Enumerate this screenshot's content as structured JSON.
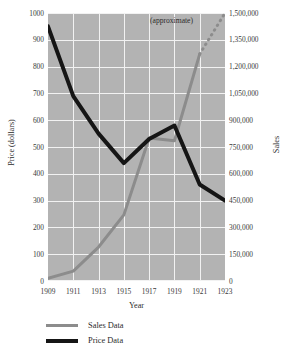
{
  "chart_data": {
    "type": "line",
    "title": "",
    "subtitle": "",
    "xlabel": "Year",
    "ylabel": "Price (dollars)",
    "ylabel_right": "Sales",
    "x": [
      1909,
      1911,
      1913,
      1915,
      1917,
      1919,
      1921,
      1923
    ],
    "xtick_labels": [
      "1909",
      "1911",
      "1913",
      "1915",
      "1917",
      "1919",
      "1921",
      "1923"
    ],
    "xlim": [
      1909,
      1923
    ],
    "ylim": [
      0,
      1000
    ],
    "ylim_right": [
      0,
      1500000
    ],
    "ytick_labels_left": [
      "1000",
      "900",
      "800",
      "700",
      "600",
      "500",
      "400",
      "300",
      "200",
      "100",
      "0"
    ],
    "ytick_values_left": [
      1000,
      900,
      800,
      700,
      600,
      500,
      400,
      300,
      200,
      100,
      0
    ],
    "ytick_labels_right": [
      "1,500,000",
      "1,350,000",
      "1,200,000",
      "1,050,000",
      "900,000",
      "750,000",
      "600,000",
      "450,000",
      "300,000",
      "150,000",
      "0"
    ],
    "ytick_values_right": [
      1500000,
      1350000,
      1200000,
      1050000,
      900000,
      750000,
      600000,
      450000,
      300000,
      150000,
      0
    ],
    "grid": true,
    "grid_color": "#f2f2f2",
    "plot_background": "#b3b3b3",
    "legend_position": "below",
    "annotations": [
      {
        "text": "(approximate)",
        "x": 1920,
        "y": 960,
        "note": "labels the dotted extrapolated segment of the Sales Data series"
      }
    ],
    "series": [
      {
        "name": "Sales Data",
        "axis": "right",
        "color": "#8c8c8c",
        "line_width": 3,
        "values": [
          15000,
          55000,
          190000,
          370000,
          800000,
          785000,
          1270000,
          1500000
        ],
        "dashed_from_x": 1921,
        "dash_note": "segment from 1921 to 1923 is drawn dotted and marked (approximate)"
      },
      {
        "name": "Price Data",
        "axis": "left",
        "color": "#151515",
        "line_width": 4,
        "values": [
          950,
          690,
          550,
          440,
          530,
          580,
          360,
          300
        ]
      }
    ]
  },
  "legend": {
    "items": [
      {
        "label": "Sales Data",
        "color": "#8c8c8c"
      },
      {
        "label": "Price Data",
        "color": "#151515"
      }
    ]
  }
}
